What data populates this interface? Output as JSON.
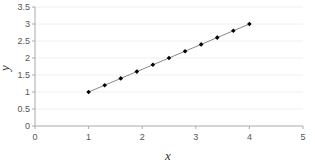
{
  "chart_data": {
    "type": "line",
    "title": "",
    "xlabel": "x",
    "ylabel": "y",
    "xlim": [
      0,
      5
    ],
    "ylim": [
      0,
      3.5
    ],
    "x_ticks": [
      "0",
      "1",
      "2",
      "3",
      "4",
      "5"
    ],
    "y_ticks": [
      "0",
      "0.5",
      "1",
      "1.5",
      "2",
      "2.5",
      "3",
      "3.5"
    ],
    "grid": true,
    "legend": null,
    "series": [
      {
        "name": "y",
        "marker": "diamond",
        "color": "#000000",
        "line_color": "#888888",
        "x": [
          1.0,
          1.3,
          1.6,
          1.9,
          2.2,
          2.5,
          2.8,
          3.1,
          3.4,
          3.7,
          4.0
        ],
        "y": [
          1.0,
          1.2,
          1.4,
          1.6,
          1.8,
          2.0,
          2.2,
          2.4,
          2.6,
          2.8,
          3.0
        ]
      }
    ]
  },
  "colors": {
    "axis": "#aaaaaa",
    "grid": "#f0f0f0",
    "marker": "#000000",
    "line": "#888888"
  }
}
